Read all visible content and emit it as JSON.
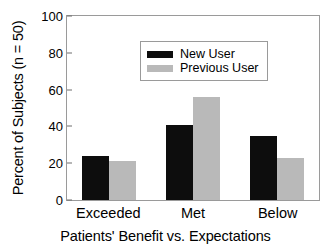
{
  "chart_data": {
    "type": "bar",
    "title": "",
    "xlabel": "Patients' Benefit vs. Expectations",
    "ylabel": "Percent of Subjects (n = 50)",
    "categories": [
      "Exceeded",
      "Met",
      "Below"
    ],
    "series": [
      {
        "name": "New User",
        "color": "#0d0d0d",
        "values": [
          24,
          41,
          35
        ]
      },
      {
        "name": "Previous User",
        "color": "#b9b9b9",
        "values": [
          21,
          56,
          23
        ]
      }
    ],
    "ylim": [
      0,
      100
    ],
    "yticks": [
      0,
      20,
      40,
      60,
      80,
      100
    ],
    "grid": false,
    "legend_position": "top-left"
  },
  "legend": {
    "items": [
      {
        "label": "New User",
        "swatch": "new"
      },
      {
        "label": "Previous User",
        "swatch": "prev"
      }
    ]
  }
}
